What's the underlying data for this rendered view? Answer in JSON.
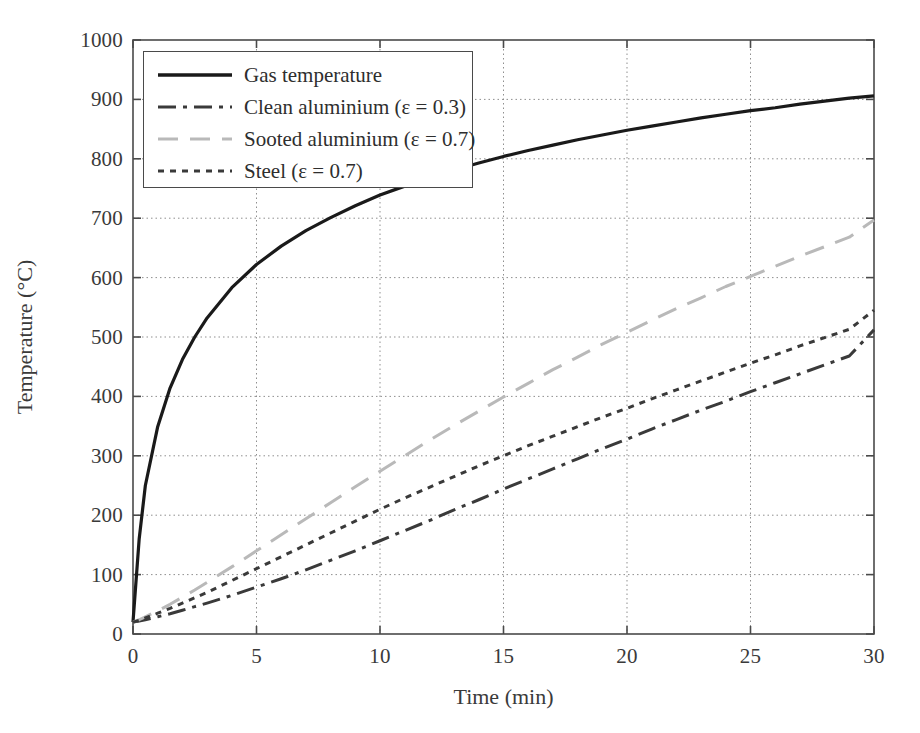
{
  "chart_data": {
    "type": "line",
    "title": "",
    "xlabel": "Time (min)",
    "ylabel": "Temperature (°C)",
    "xlim": [
      0,
      30
    ],
    "ylim": [
      0,
      1000
    ],
    "xticks": [
      "0",
      "5",
      "10",
      "15",
      "20",
      "25",
      "30"
    ],
    "yticks": [
      "0",
      "100",
      "200",
      "300",
      "400",
      "500",
      "600",
      "700",
      "800",
      "900",
      "1000"
    ],
    "grid": "dotted both axes",
    "legend_position": "upper left, inside axes",
    "x": [
      0,
      0.25,
      0.5,
      1,
      1.5,
      2,
      2.5,
      3,
      4,
      5,
      6,
      7,
      8,
      9,
      10,
      11,
      12,
      13,
      14,
      15,
      16,
      17,
      18,
      19,
      20,
      21,
      22,
      23,
      24,
      25,
      26,
      27,
      28,
      29,
      30
    ],
    "series": [
      {
        "name": "Gas temperature",
        "style": "solid",
        "color": "#1a1a1a",
        "width": 3.2,
        "values": [
          20,
          160,
          250,
          349,
          414,
          462,
          500,
          532,
          583,
          622,
          653,
          679,
          701,
          721,
          739,
          754,
          768,
          781,
          793,
          804,
          814,
          823,
          832,
          840,
          848,
          855,
          862,
          869,
          875,
          881,
          886,
          892,
          897,
          902,
          906
        ]
      },
      {
        "name": "Clean aluminium (ε = 0.3)",
        "style": "dashdot",
        "color": "#3a3a3a",
        "width": 3.0,
        "values": [
          20,
          22,
          24,
          29,
          34,
          40,
          46,
          52,
          65,
          79,
          93,
          108,
          124,
          140,
          157,
          174,
          191,
          209,
          226,
          244,
          261,
          278,
          295,
          312,
          328,
          345,
          361,
          377,
          392,
          408,
          423,
          438,
          453,
          468,
          512
        ]
      },
      {
        "name": "Sooted aluminium (ε = 0.7)",
        "style": "longdash",
        "color": "#b9b9b9",
        "width": 3.0,
        "values": [
          20,
          24,
          29,
          39,
          50,
          62,
          74,
          87,
          113,
          140,
          167,
          194,
          221,
          248,
          274,
          300,
          326,
          351,
          375,
          399,
          422,
          445,
          466,
          488,
          508,
          528,
          548,
          566,
          585,
          602,
          619,
          636,
          652,
          668,
          697
        ]
      },
      {
        "name": "Steel (ε = 0.7)",
        "style": "dotted",
        "color": "#3a3a3a",
        "width": 3.0,
        "values": [
          20,
          23,
          27,
          35,
          43,
          52,
          61,
          70,
          90,
          110,
          130,
          150,
          170,
          190,
          210,
          229,
          247,
          265,
          283,
          300,
          317,
          333,
          349,
          365,
          380,
          396,
          411,
          426,
          441,
          456,
          470,
          485,
          499,
          513,
          545
        ]
      }
    ]
  },
  "axes": {
    "y_title": "Temperature (°C)",
    "x_title": "Time (min)",
    "y_tick_labels": [
      "1000",
      "900",
      "800",
      "700",
      "600",
      "500",
      "400",
      "300",
      "200",
      "100",
      "0"
    ],
    "x_tick_labels": [
      "0",
      "5",
      "10",
      "15",
      "20",
      "25",
      "30"
    ]
  },
  "legend": {
    "entries": [
      {
        "label": "Gas temperature",
        "style": "solid",
        "color": "#1a1a1a"
      },
      {
        "label": "Clean aluminium (ε = 0.3)",
        "style": "dashdot",
        "color": "#3a3a3a"
      },
      {
        "label": "Sooted aluminium (ε = 0.7)",
        "style": "longdash",
        "color": "#b9b9b9"
      },
      {
        "label": "Steel (ε = 0.7)",
        "style": "dotted",
        "color": "#3a3a3a"
      }
    ]
  },
  "colors": {
    "axis": "#4a4a4a",
    "grid": "#8f8f8f",
    "text": "#2e2e2e",
    "background": "#ffffff"
  }
}
